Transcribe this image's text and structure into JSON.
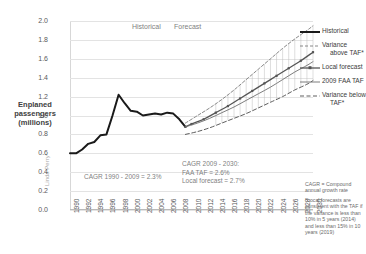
{
  "top_cropped_text": "",
  "axis": {
    "y_title": "Enplaned passengers (millions)",
    "y_ticks": [
      "2.0",
      "1.8",
      "1.6",
      "1.4",
      "1.2",
      "1.0",
      "0.8",
      "0.6",
      "0.4",
      "0.2",
      "0.0"
    ],
    "x_ticks": [
      "1990",
      "1992",
      "1994",
      "1996",
      "1998",
      "2000",
      "2002",
      "2004",
      "2006",
      "2008",
      "2010",
      "2012",
      "2014",
      "2016",
      "2018",
      "2020",
      "2022",
      "2024",
      "2026",
      "2028",
      "2030"
    ]
  },
  "period_labels": {
    "historical": "Historical",
    "forecast": "Forecast"
  },
  "annotations": {
    "cagr_historical": "CAGR 1990 - 2009 = 2.3%",
    "cagr_forecast": "CAGR 2009 - 2030:\nFAA TAF  = 2.6%\nLocal forecast = 2.7%",
    "note_cagr": "CAGR = Compound annual growth rate",
    "note_star": "*Local forecasts are consistent with the TAF if the variance is less than 10% in 5 years (2014) and less than 15% in 10 years (2019)"
  },
  "watermark": "Linda Perry",
  "legend": [
    {
      "label": "Historical",
      "label2": "",
      "style": "solid-thick",
      "color": "#1a1a1a"
    },
    {
      "label": "Variance",
      "label2": "above TAF*",
      "style": "dashed",
      "color": "#7a7a7a"
    },
    {
      "label": "Local forecast",
      "label2": "",
      "style": "marker",
      "color": "#555555"
    },
    {
      "label": "2009 FAA TAF",
      "label2": "",
      "style": "solid-thin",
      "color": "#6e6e6e"
    },
    {
      "label": "Variance below",
      "label2": "TAF*",
      "style": "dashed-long",
      "color": "#5e5e5e"
    }
  ],
  "chart_data": {
    "type": "line",
    "title": "Enplaned passengers (millions)",
    "xlabel": "",
    "ylabel": "Enplaned passengers (millions)",
    "xlim": [
      1990,
      2030
    ],
    "ylim": [
      0.0,
      2.0
    ],
    "y_tick_step": 0.2,
    "x_tick_step": 2,
    "grid": "horizontal",
    "legend_position": "right",
    "forecast_split_year": 2009,
    "series": [
      {
        "name": "Historical",
        "style": "solid-thick",
        "color": "#1a1a1a",
        "x": [
          1990,
          1991,
          1992,
          1993,
          1994,
          1995,
          1996,
          1997,
          1998,
          1999,
          2000,
          2001,
          2002,
          2003,
          2004,
          2005,
          2006,
          2007,
          2008,
          2009
        ],
        "values": [
          0.6,
          0.6,
          0.64,
          0.7,
          0.72,
          0.79,
          0.8,
          1.0,
          1.22,
          1.13,
          1.05,
          1.04,
          1.0,
          1.01,
          1.02,
          1.01,
          1.03,
          1.02,
          0.96,
          0.88
        ]
      },
      {
        "name": "Variance above TAF*",
        "style": "dashed",
        "color": "#7a7a7a",
        "x": [
          2009,
          2011,
          2013,
          2015,
          2017,
          2019,
          2021,
          2023,
          2025,
          2027,
          2029,
          2030
        ],
        "values": [
          0.92,
          1.0,
          1.08,
          1.17,
          1.27,
          1.38,
          1.49,
          1.6,
          1.71,
          1.81,
          1.9,
          1.95
        ]
      },
      {
        "name": "Local forecast",
        "style": "marker",
        "color": "#555555",
        "x": [
          2009,
          2010,
          2012,
          2014,
          2016,
          2018,
          2020,
          2022,
          2024,
          2026,
          2028,
          2030
        ],
        "values": [
          0.88,
          0.91,
          0.96,
          1.03,
          1.1,
          1.18,
          1.26,
          1.34,
          1.42,
          1.5,
          1.58,
          1.67
        ]
      },
      {
        "name": "2009 FAA TAF",
        "style": "solid-thin",
        "color": "#6e6e6e",
        "x": [
          2009,
          2011,
          2013,
          2015,
          2017,
          2019,
          2021,
          2023,
          2025,
          2027,
          2029,
          2030
        ],
        "values": [
          0.88,
          0.92,
          0.97,
          1.03,
          1.09,
          1.16,
          1.23,
          1.3,
          1.38,
          1.46,
          1.53,
          1.57
        ]
      },
      {
        "name": "Variance below TAF*",
        "style": "dashed-long",
        "color": "#5e5e5e",
        "x": [
          2009,
          2011,
          2013,
          2015,
          2017,
          2019,
          2021,
          2023,
          2025,
          2027,
          2029,
          2030
        ],
        "values": [
          0.8,
          0.83,
          0.87,
          0.92,
          0.97,
          1.02,
          1.08,
          1.14,
          1.2,
          1.27,
          1.33,
          1.37
        ]
      }
    ]
  }
}
